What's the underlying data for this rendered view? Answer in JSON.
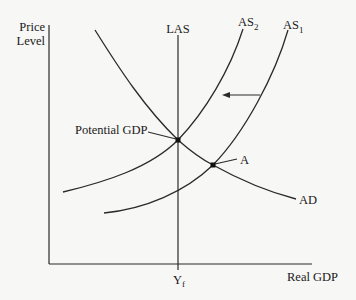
{
  "diagram": {
    "y_axis_label_line1": "Price",
    "y_axis_label_line2": "Level",
    "x_axis_label": "Real GDP",
    "las_label": "LAS",
    "as2_label": "AS",
    "as2_sub": "2",
    "as1_label": "AS",
    "as1_sub": "1",
    "ad_label": "AD",
    "point_a_label": "A",
    "potential_gdp_label": "Potential GDP",
    "yf_label": "Y",
    "yf_sub": "f",
    "arrow_direction": "left",
    "colors": {
      "line": "#2a2a2a",
      "background": "#f7f7f5"
    }
  }
}
